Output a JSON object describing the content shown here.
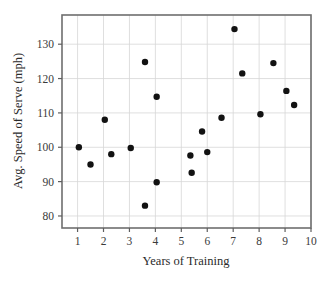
{
  "chart_data": {
    "type": "scatter",
    "title": "",
    "xlabel": "Years of Training",
    "ylabel": "Avg. Speed of Serve (mph)",
    "xlim": [
      0.4,
      10.0
    ],
    "ylim": [
      76.5,
      138.5
    ],
    "xticks": [
      1,
      2,
      3,
      4,
      5,
      6,
      7,
      8,
      9,
      10
    ],
    "xtick_labels": [
      "1",
      "2",
      "3",
      "4",
      "5",
      "6",
      "7",
      "8",
      "9",
      "10"
    ],
    "yticks": [
      80,
      90,
      100,
      110,
      120,
      130
    ],
    "ytick_labels": [
      "80",
      "90",
      "100",
      "110",
      "120",
      "130"
    ],
    "grid": true,
    "legend": "none",
    "marker": "filled-circle",
    "marker_color": "#121212",
    "grid_color": "#d7d7d7",
    "frame_color": "#6e6e6e",
    "background_color": "#ffffff",
    "points": [
      {
        "x": 1.05,
        "y": 100.0
      },
      {
        "x": 1.5,
        "y": 95.0
      },
      {
        "x": 2.05,
        "y": 108.0
      },
      {
        "x": 2.3,
        "y": 98.0
      },
      {
        "x": 3.05,
        "y": 99.8
      },
      {
        "x": 3.6,
        "y": 124.8
      },
      {
        "x": 3.6,
        "y": 83.0
      },
      {
        "x": 4.05,
        "y": 114.7
      },
      {
        "x": 4.05,
        "y": 89.8
      },
      {
        "x": 5.35,
        "y": 97.6
      },
      {
        "x": 5.4,
        "y": 92.6
      },
      {
        "x": 5.8,
        "y": 104.6
      },
      {
        "x": 6.0,
        "y": 98.6
      },
      {
        "x": 6.55,
        "y": 108.6
      },
      {
        "x": 7.05,
        "y": 134.4
      },
      {
        "x": 7.35,
        "y": 121.5
      },
      {
        "x": 8.05,
        "y": 109.6
      },
      {
        "x": 8.55,
        "y": 124.5
      },
      {
        "x": 9.05,
        "y": 116.4
      },
      {
        "x": 9.35,
        "y": 112.3
      }
    ]
  },
  "axes": {
    "x_axis_title": "Years of Training",
    "y_axis_title": "Avg. Speed of Serve (mph)"
  }
}
